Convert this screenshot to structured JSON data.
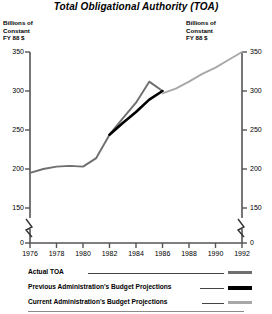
{
  "chart_data": {
    "type": "line",
    "title": "Total Obligational Authority (TOA)",
    "xlabel": "",
    "ylabel": "Billions of Constant FY 88 $",
    "ylabel_left": "Billions of\nConstant\nFY 88 $",
    "ylabel_right": "Billions of\nConstant\nFY 88 $",
    "xlim": [
      1976,
      1992
    ],
    "ylim": [
      150,
      350
    ],
    "y_axis_break": true,
    "y_break_value": 0,
    "grid": false,
    "legend_position": "bottom",
    "xticks": [
      1976,
      1978,
      1980,
      1982,
      1984,
      1986,
      1988,
      1990,
      1992
    ],
    "xtick_labels": [
      "1976",
      "1978",
      "1980",
      "1982",
      "1984",
      "1986",
      "1988",
      "1990",
      "1992"
    ],
    "yticks": [
      0,
      150,
      200,
      250,
      300,
      350
    ],
    "ytick_labels": [
      "0",
      "150",
      "200",
      "250",
      "300",
      "350"
    ],
    "series": [
      {
        "name": "Actual TOA",
        "color": "#6f6f6f",
        "width": 1.9,
        "x": [
          1976,
          1977,
          1978,
          1979,
          1980,
          1981,
          1982,
          1983,
          1984,
          1985,
          1986
        ],
        "values": [
          195,
          200,
          203,
          204,
          203,
          214,
          244,
          265,
          285,
          312,
          300
        ]
      },
      {
        "name": "Previous Administration's Budget Projections",
        "color": "#000000",
        "width": 2.6,
        "x": [
          1982,
          1983,
          1984,
          1985,
          1986
        ],
        "values": [
          244,
          259,
          273,
          289,
          300
        ]
      },
      {
        "name": "Current Administration's Budget Projections",
        "color": "#a8a8a8",
        "width": 1.9,
        "x": [
          1986,
          1987,
          1988,
          1989,
          1990,
          1991,
          1992
        ],
        "values": [
          297,
          303,
          312,
          322,
          330,
          340,
          350
        ]
      }
    ]
  },
  "legend": {
    "items": [
      {
        "label": "Actual TOA",
        "swatch": "sw-actual"
      },
      {
        "label": "Previous Administration's Budget Projections",
        "swatch": "sw-prev"
      },
      {
        "label": "Current Administration's Budget Projections",
        "swatch": "sw-curr"
      }
    ]
  }
}
